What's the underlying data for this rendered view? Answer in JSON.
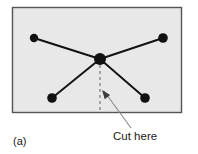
{
  "figure": {
    "panel_label": "(a)",
    "annotation_label": "Cut here",
    "colors": {
      "panel_fill": "#e8e8e8",
      "panel_border": "#555555",
      "node_fill": "#111111",
      "edge_stroke": "#111111",
      "cut_line_stroke": "#6e6e6e",
      "leader_stroke": "#8a8a8a",
      "text": "#1a1a1a",
      "page_background": "#ffffff"
    },
    "panel": {
      "x": 12,
      "y": 7,
      "width": 170,
      "height": 106
    },
    "nodes": [
      {
        "id": "center",
        "label": "center-node",
        "cx": 100,
        "cy": 59,
        "r": 6.0
      },
      {
        "id": "top-left",
        "label": "top-left-node",
        "cx": 34,
        "cy": 38,
        "r": 4.2
      },
      {
        "id": "top-right",
        "label": "top-right-node",
        "cx": 163,
        "cy": 38,
        "r": 4.8
      },
      {
        "id": "bottom-left",
        "label": "bottom-left-node",
        "cx": 52,
        "cy": 98,
        "r": 4.8
      },
      {
        "id": "bottom-right",
        "label": "bottom-right-node",
        "cx": 145,
        "cy": 98,
        "r": 4.8
      }
    ],
    "edges": [
      {
        "id": "edge-center-top-left",
        "from": "center",
        "to": "top-left"
      },
      {
        "id": "edge-center-top-right",
        "from": "center",
        "to": "top-right"
      },
      {
        "id": "edge-center-bottom-left",
        "from": "center",
        "to": "bottom-left"
      },
      {
        "id": "edge-center-bottom-right",
        "from": "center",
        "to": "bottom-right"
      }
    ],
    "cut_line": {
      "x1": 100,
      "y1": 59,
      "x2": 100,
      "y2": 112,
      "dash": "3 3"
    },
    "leader": {
      "tip_x": 102,
      "tip_y": 90,
      "tail_x": 131,
      "tail_y": 128
    }
  }
}
